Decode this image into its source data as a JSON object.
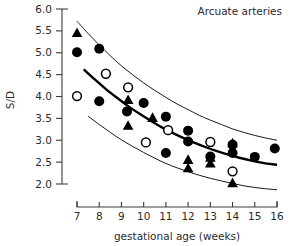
{
  "chart_data": {
    "type": "scatter",
    "title": "Arcuate arteries",
    "xlabel": "gestational age (weeks)",
    "ylabel": "S/D",
    "xlim": [
      6.5,
      16.3
    ],
    "ylim": [
      1.8,
      6.0
    ],
    "grid": false,
    "legend_position": "none",
    "xticks": [
      7,
      8,
      9,
      10,
      11,
      12,
      13,
      14,
      15,
      16
    ],
    "xtick_labels": [
      "7",
      "8",
      "9",
      "10",
      "11",
      "12",
      "13",
      "14",
      "15",
      "16"
    ],
    "yticks": [
      2.0,
      2.5,
      3.0,
      3.5,
      4.0,
      4.5,
      5.0,
      5.5,
      6.0
    ],
    "ytick_labels": [
      "2.0",
      "2.5",
      "3.0",
      "3.5",
      "4.0",
      "4.5",
      "5.0",
      "5.5",
      "6.0"
    ],
    "reference_curves": [
      {
        "name": "upper reference limit",
        "style": "thin",
        "points": [
          [
            7.0,
            5.72
          ],
          [
            7.5,
            5.44
          ],
          [
            8.0,
            5.18
          ],
          [
            8.5,
            4.93
          ],
          [
            9.0,
            4.7
          ],
          [
            9.5,
            4.5
          ],
          [
            10.0,
            4.31
          ],
          [
            10.5,
            4.14
          ],
          [
            11.0,
            3.98
          ],
          [
            11.5,
            3.83
          ],
          [
            12.0,
            3.7
          ],
          [
            12.5,
            3.57
          ],
          [
            13.0,
            3.46
          ],
          [
            13.5,
            3.36
          ],
          [
            14.0,
            3.26
          ],
          [
            14.5,
            3.18
          ],
          [
            15.0,
            3.11
          ],
          [
            15.5,
            3.05
          ],
          [
            16.0,
            3.0
          ]
        ]
      },
      {
        "name": "median",
        "style": "thick",
        "points": [
          [
            7.3,
            4.62
          ],
          [
            7.8,
            4.39
          ],
          [
            8.3,
            4.17
          ],
          [
            8.8,
            3.97
          ],
          [
            9.3,
            3.78
          ],
          [
            9.8,
            3.61
          ],
          [
            10.3,
            3.45
          ],
          [
            10.8,
            3.3
          ],
          [
            11.3,
            3.17
          ],
          [
            11.8,
            3.05
          ],
          [
            12.3,
            2.94
          ],
          [
            12.8,
            2.84
          ],
          [
            13.3,
            2.75
          ],
          [
            13.8,
            2.67
          ],
          [
            14.3,
            2.6
          ],
          [
            14.8,
            2.54
          ],
          [
            15.3,
            2.49
          ],
          [
            15.8,
            2.45
          ],
          [
            16.0,
            2.44
          ]
        ]
      },
      {
        "name": "lower reference limit",
        "style": "thin",
        "points": [
          [
            7.5,
            3.55
          ],
          [
            8.0,
            3.36
          ],
          [
            8.5,
            3.18
          ],
          [
            9.0,
            3.01
          ],
          [
            9.5,
            2.86
          ],
          [
            10.0,
            2.72
          ],
          [
            10.5,
            2.59
          ],
          [
            11.0,
            2.47
          ],
          [
            11.5,
            2.37
          ],
          [
            12.0,
            2.28
          ],
          [
            12.5,
            2.2
          ],
          [
            13.0,
            2.13
          ],
          [
            13.5,
            2.07
          ],
          [
            14.0,
            2.01
          ],
          [
            14.5,
            1.96
          ],
          [
            15.0,
            1.92
          ],
          [
            15.5,
            1.89
          ],
          [
            16.0,
            1.87
          ]
        ]
      }
    ],
    "series": [
      {
        "name": "filled circle",
        "marker": "filled-circle",
        "points": [
          [
            7.0,
            5.01
          ],
          [
            8.0,
            5.09
          ],
          [
            8.0,
            3.89
          ],
          [
            9.25,
            3.66
          ],
          [
            10.0,
            3.85
          ],
          [
            11.0,
            3.54
          ],
          [
            11.0,
            2.71
          ],
          [
            12.0,
            3.22
          ],
          [
            12.0,
            2.97
          ],
          [
            13.0,
            2.63
          ],
          [
            14.0,
            2.9
          ],
          [
            14.0,
            2.71
          ],
          [
            15.0,
            2.62
          ],
          [
            15.9,
            2.81
          ]
        ]
      },
      {
        "name": "open circle",
        "marker": "open-circle",
        "points": [
          [
            7.0,
            4.01
          ],
          [
            8.3,
            4.52
          ],
          [
            9.3,
            4.21
          ],
          [
            10.1,
            2.95
          ],
          [
            11.1,
            3.23
          ],
          [
            13.0,
            2.96
          ],
          [
            14.0,
            2.29
          ]
        ]
      },
      {
        "name": "filled triangle",
        "marker": "filled-triangle",
        "points": [
          [
            7.0,
            5.45
          ],
          [
            9.3,
            3.92
          ],
          [
            9.3,
            3.33
          ],
          [
            10.4,
            3.51
          ],
          [
            12.0,
            2.55
          ],
          [
            12.0,
            2.36
          ],
          [
            13.0,
            2.6
          ],
          [
            13.0,
            2.47
          ],
          [
            14.0,
            2.93
          ],
          [
            14.0,
            2.02
          ]
        ]
      }
    ]
  }
}
